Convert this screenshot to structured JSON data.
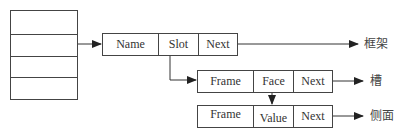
{
  "diagram": {
    "type": "frame-slot-facet linked structure",
    "stack": {
      "rows": 4
    },
    "frame_record": {
      "cells": [
        "Name",
        "Slot",
        "Next"
      ],
      "target_label": "框架"
    },
    "slot_record": {
      "cells": [
        "Frame",
        "Face",
        "Next"
      ],
      "target_label": "槽"
    },
    "facet_record": {
      "cells": [
        "Frame",
        "Value",
        "Next"
      ],
      "target_label": "侧面"
    },
    "colors": {
      "line": "#444444",
      "text": "#333333",
      "background": "#ffffff"
    },
    "connections": [
      {
        "from": "stack.row2",
        "to": "frame_record"
      },
      {
        "from": "frame_record.Slot",
        "to": "slot_record"
      },
      {
        "from": "slot_record.Face",
        "to": "facet_record.Value"
      },
      {
        "from": "frame_record.Next",
        "to": "框架"
      },
      {
        "from": "slot_record.Next",
        "to": "槽"
      },
      {
        "from": "facet_record.Next",
        "to": "侧面"
      }
    ]
  }
}
